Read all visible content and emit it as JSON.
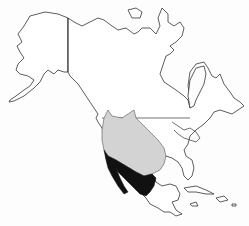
{
  "map": {
    "title": "Range map of a species in North America",
    "region": "North America",
    "colors": {
      "background": "#fdfdfd",
      "land": "#ffffff",
      "outline": "#333333",
      "range_primary": "#d3d3d3",
      "range_secondary": "#111111"
    },
    "regions_shown": [
      "Alaska",
      "Canada",
      "United States",
      "Mexico",
      "Caribbean islands"
    ],
    "range_layers": [
      {
        "name": "primary-range",
        "fill": "light gray",
        "extent": "Western United States from southern Canada border through Great Basin and Southwest to Texas"
      },
      {
        "name": "secondary-range",
        "fill": "black",
        "extent": "Southern California, Baja California, Arizona, and northern Mexico"
      }
    ]
  }
}
